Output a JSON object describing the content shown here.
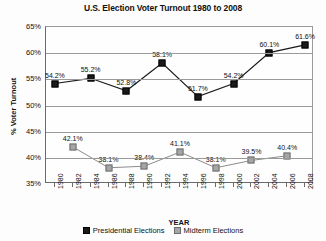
{
  "chart_data": {
    "type": "line",
    "title": "U.S. Election Voter Turnout 1980 to 2008",
    "xlabel": "YEAR",
    "ylabel": "% Voter Turnout",
    "ylim": [
      35,
      65
    ],
    "ytick_labels": [
      "65%",
      "60%",
      "55%",
      "50%",
      "45%",
      "40%",
      "35%"
    ],
    "yticks": [
      65,
      60,
      55,
      50,
      45,
      40,
      35
    ],
    "grid": true,
    "legend_position": "bottom",
    "x": [
      1980,
      1982,
      1984,
      1986,
      1988,
      1990,
      1992,
      1994,
      1996,
      1998,
      2000,
      2002,
      2004,
      2006,
      2008
    ],
    "xtick_labels": [
      "1980",
      "1982",
      "1984",
      "1986",
      "1988",
      "1990",
      "1992",
      "1994",
      "1996",
      "1998",
      "2000",
      "2002",
      "2004",
      "2006",
      "2008"
    ],
    "series": [
      {
        "name": "Presidential Elections",
        "color": "#1a1a1a",
        "marker": "square-filled-black",
        "points": [
          {
            "x": 1980,
            "y": 54.2,
            "label": "54.2%"
          },
          {
            "x": 1984,
            "y": 55.2,
            "label": "55.2%"
          },
          {
            "x": 1988,
            "y": 52.8,
            "label": "52.8%"
          },
          {
            "x": 1992,
            "y": 58.1,
            "label": "58.1%"
          },
          {
            "x": 1996,
            "y": 51.7,
            "label": "51.7%"
          },
          {
            "x": 2000,
            "y": 54.2,
            "label": "54.2%"
          },
          {
            "x": 2004,
            "y": 60.1,
            "label": "60.1%"
          },
          {
            "x": 2008,
            "y": 61.6,
            "label": "61.6%"
          }
        ]
      },
      {
        "name": "Midterm Elections",
        "color": "#a6a6a6",
        "marker": "square-filled-gray",
        "points": [
          {
            "x": 1982,
            "y": 42.1,
            "label": "42.1%"
          },
          {
            "x": 1986,
            "y": 38.1,
            "label": "38.1%"
          },
          {
            "x": 1990,
            "y": 38.4,
            "label": "38.4%"
          },
          {
            "x": 1994,
            "y": 41.1,
            "label": "41.1%"
          },
          {
            "x": 1998,
            "y": 38.1,
            "label": "38.1%"
          },
          {
            "x": 2002,
            "y": 39.5,
            "label": "39.5%"
          },
          {
            "x": 2006,
            "y": 40.4,
            "label": "40.4%"
          }
        ]
      }
    ]
  },
  "legend": {
    "items": [
      {
        "label": "Presidential Elections"
      },
      {
        "label": "Midterm Elections"
      }
    ]
  }
}
